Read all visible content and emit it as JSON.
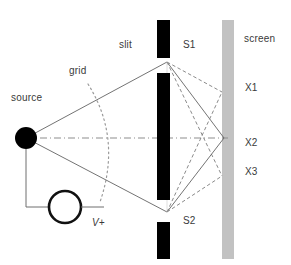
{
  "figure": {
    "type": "physics-schematic",
    "title_visible": false,
    "background_color": "#ffffff",
    "width": 291,
    "height": 265
  },
  "labels": {
    "source": "source",
    "grid": "grid",
    "slit": "slit",
    "s1": "S1",
    "s2": "S2",
    "screen": "screen",
    "x1": "X1",
    "x2": "X2",
    "x3": "X3",
    "voltage": "V+"
  },
  "colors": {
    "barrier": "#000000",
    "screen": "#c0c0c0",
    "source_dot": "#000000",
    "ray_solid": "#555555",
    "ray_dashed": "#777777",
    "grid_arc": "#9a9a9a",
    "wire": "#6a6a6a",
    "text": "#3a3a3a"
  },
  "geometry": {
    "source_point": {
      "x": 26,
      "y": 138,
      "r": 11
    },
    "slit_opening_top": {
      "x": 167,
      "y": 62
    },
    "slit_opening_bottom": {
      "x": 167,
      "y": 212
    },
    "barriers": [
      {
        "name": "top-barrier",
        "x": 157,
        "y": 20,
        "w": 13,
        "h": 38
      },
      {
        "name": "middle-barrier",
        "x": 157,
        "y": 73,
        "w": 13,
        "h": 127
      },
      {
        "name": "bottom-barrier",
        "x": 157,
        "y": 222,
        "w": 13,
        "h": 37
      }
    ],
    "screen_bar": {
      "x": 222,
      "y": 20,
      "w": 12,
      "h": 239
    },
    "screen_points": [
      {
        "name": "X1",
        "x": 222,
        "y": 92
      },
      {
        "name": "X2",
        "x": 222,
        "y": 138
      },
      {
        "name": "X3",
        "x": 222,
        "y": 176
      }
    ],
    "voltage_circle": {
      "x": 65,
      "y": 207,
      "r": 16
    }
  }
}
